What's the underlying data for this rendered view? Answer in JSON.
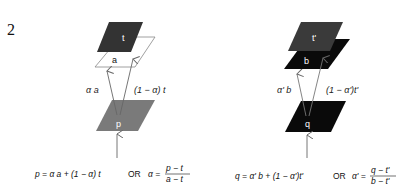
{
  "figure_number": "2",
  "left": {
    "planes": {
      "top": {
        "label": "t",
        "color": "#333333"
      },
      "middle": {
        "label": "a",
        "color": "#ffffff",
        "stroke": "#777777"
      },
      "bottom": {
        "label": "p",
        "color": "#777777"
      }
    },
    "arrow_labels": {
      "left": "α a",
      "right": "(1 − α) t"
    },
    "formula": {
      "main": "p = α a + (1 − α) t",
      "or": "OR",
      "lhs": "α =",
      "numerator": "p − t",
      "denominator": "a − t"
    }
  },
  "right": {
    "planes": {
      "top": {
        "label": "t'",
        "color": "#3a3a3a"
      },
      "middle": {
        "label": "b",
        "color": "#0a0a0a"
      },
      "bottom": {
        "label": "q",
        "color": "#0a0a0a"
      }
    },
    "arrow_labels": {
      "left": "α' b",
      "right": "(1 − α')t'"
    },
    "formula": {
      "main": "q = α' b + (1 − α')t'",
      "or": "OR",
      "lhs": "α' =",
      "numerator": "q − t'",
      "denominator": "b − t'"
    }
  }
}
